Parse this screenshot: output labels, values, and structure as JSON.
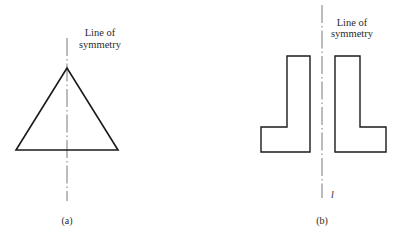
{
  "figure": {
    "panels": [
      {
        "id": "a",
        "caption": "(a)",
        "shape": "equilateral-triangle",
        "axis_label_line1": "Line of",
        "axis_label_line2": "symmetry"
      },
      {
        "id": "b",
        "caption": "(b)",
        "shape": "mirrored-L-shapes",
        "axis_label_line1": "Line of",
        "axis_label_line2": "symmetry",
        "axis_name": "l"
      }
    ],
    "colors": {
      "stroke": "#1a1a1a",
      "axis": "#555555",
      "background": "#ffffff"
    }
  }
}
